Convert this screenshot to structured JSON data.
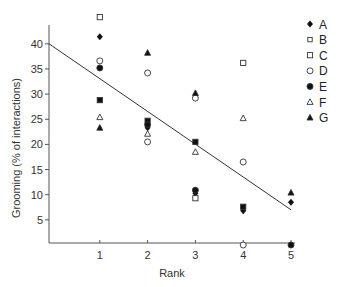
{
  "chart_data": {
    "type": "scatter",
    "title": "",
    "xlabel": "Rank",
    "ylabel": "Grooming (% of interactions)",
    "x_ticks": [
      1,
      2,
      3,
      4,
      5
    ],
    "y_ticks": [
      5,
      10,
      15,
      20,
      25,
      30,
      35,
      40
    ],
    "xlim": [
      0,
      5
    ],
    "ylim": [
      0,
      45
    ],
    "grid": false,
    "legend_position": "right",
    "series": [
      {
        "name": "A",
        "marker": "diamond-filled",
        "points": [
          [
            1,
            41.4
          ],
          [
            2,
            23.3
          ],
          [
            3,
            10.3
          ],
          [
            4,
            6.8
          ],
          [
            5,
            8.5
          ]
        ]
      },
      {
        "name": "B",
        "marker": "square-filled",
        "points": [
          [
            1,
            28.8
          ],
          [
            2,
            24.7
          ],
          [
            3,
            20.5
          ],
          [
            4,
            7.6
          ]
        ]
      },
      {
        "name": "C",
        "marker": "square-open",
        "points": [
          [
            1,
            45.3
          ],
          [
            3,
            9.3
          ],
          [
            4,
            36.2
          ]
        ]
      },
      {
        "name": "D",
        "marker": "circle-open",
        "points": [
          [
            1,
            36.6
          ],
          [
            2,
            34.2
          ],
          [
            2,
            20.5
          ],
          [
            3,
            29.2
          ],
          [
            4,
            16.5
          ],
          [
            4,
            0
          ]
        ]
      },
      {
        "name": "E",
        "marker": "circle-filled",
        "points": [
          [
            1,
            35.2
          ],
          [
            2,
            23.9
          ],
          [
            3,
            10.9
          ],
          [
            5,
            0
          ]
        ]
      },
      {
        "name": "F",
        "marker": "triangle-open",
        "points": [
          [
            1,
            25.4
          ],
          [
            2,
            22.1
          ],
          [
            3,
            18.5
          ],
          [
            4,
            25.2
          ]
        ]
      },
      {
        "name": "G",
        "marker": "triangle-filled",
        "points": [
          [
            1,
            23.3
          ],
          [
            2,
            38.2
          ],
          [
            3,
            30.2
          ],
          [
            5,
            10.4
          ]
        ]
      }
    ],
    "regression_line": {
      "x": [
        0,
        5
      ],
      "y": [
        40,
        7
      ]
    }
  },
  "legend": {
    "items": [
      {
        "label": "A",
        "marker": "diamond-filled"
      },
      {
        "label": "B",
        "marker": "square-open-small"
      },
      {
        "label": "C",
        "marker": "square-open"
      },
      {
        "label": "D",
        "marker": "circle-open"
      },
      {
        "label": "E",
        "marker": "circle-filled"
      },
      {
        "label": "F",
        "marker": "triangle-open"
      },
      {
        "label": "G",
        "marker": "triangle-filled"
      }
    ]
  },
  "axes": {
    "x_label": "Rank",
    "y_label": "Grooming (% of interactions)",
    "x_tick_labels": [
      "1",
      "2",
      "3",
      "4",
      "5"
    ],
    "y_tick_labels": [
      "5",
      "10",
      "15",
      "20",
      "25",
      "30",
      "35",
      "40"
    ]
  }
}
